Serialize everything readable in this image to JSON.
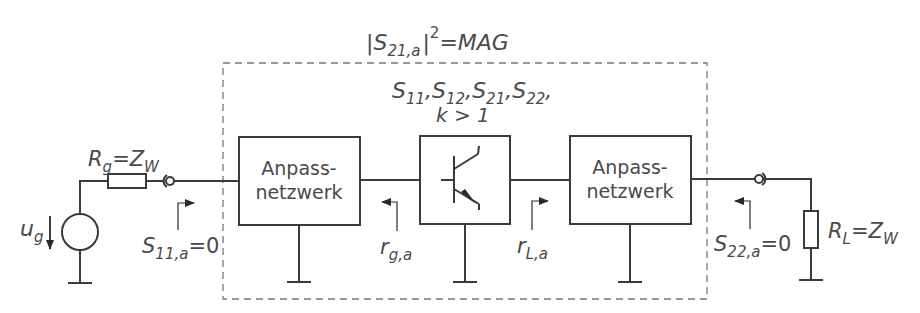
{
  "diagram": {
    "title": {
      "base": "|S",
      "sub": "21,a",
      "bar": "|",
      "sup": "2",
      "rest": "=MAG"
    },
    "inner_params": {
      "line1": [
        {
          "base": "S",
          "sub": "11",
          "sep": ","
        },
        {
          "base": "S",
          "sub": "12",
          "sep": ","
        },
        {
          "base": "S",
          "sub": "21",
          "sep": ","
        },
        {
          "base": "S",
          "sub": "22",
          "sep": ","
        }
      ],
      "line2": "k > 1"
    },
    "blocks": {
      "input_match": {
        "line1": "Anpass-",
        "line2": "netzwerk"
      },
      "transistor": {
        "symbol": "npn-bipolar-transistor"
      },
      "output_match": {
        "line1": "Anpass-",
        "line2": "netzwerk"
      }
    },
    "source": {
      "resistor_label": {
        "base": "R",
        "sub": "g",
        "eq": "=Z",
        "sub2": "W"
      },
      "voltage_label": {
        "base": "u",
        "sub": "g"
      }
    },
    "load": {
      "resistor_label": {
        "base": "R",
        "sub": "L",
        "eq": "=Z",
        "sub2": "W"
      }
    },
    "reflections": {
      "s11": {
        "base": "S",
        "sub": "11,a",
        "rest": "=0"
      },
      "rg": {
        "base": "r",
        "sub": "g,a"
      },
      "rl": {
        "base": "r",
        "sub": "L,a"
      },
      "s22": {
        "base": "S",
        "sub": "22,a",
        "rest": "=0"
      }
    }
  }
}
